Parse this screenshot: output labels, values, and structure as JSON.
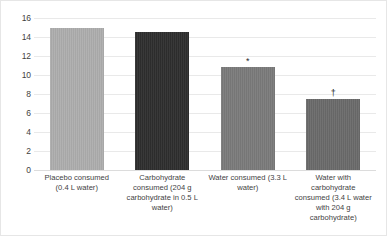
{
  "chart_data": {
    "type": "bar",
    "title": "",
    "subtitle": "",
    "xlabel": "",
    "ylabel": "",
    "ylim": [
      0,
      16
    ],
    "ytick_step": 2,
    "yticks": [
      "16",
      "14",
      "12",
      "10",
      "8",
      "6",
      "4",
      "2",
      "0"
    ],
    "grid": "horizontal",
    "legend": "none",
    "categories": [
      "Placebo consumed (0.4 L water)",
      "Carbohydrate consumed (204 g carbohydrate in 0.5 L water)",
      "Water consumed (3.3 L water)",
      "Water with carbohydrate consumed (3.4 L water with 204 g carbohydrate)"
    ],
    "values": [
      15.0,
      14.5,
      10.8,
      7.5
    ],
    "annotations": [
      "",
      "",
      "*",
      "†"
    ],
    "bar_colors": [
      "#adadad",
      "#2e2e2e",
      "#7a7a7a",
      "#6a6a6a"
    ],
    "grid_color": "#e9e9e9",
    "axis_text_color": "#3f3f3f",
    "background_color": "#ffffff",
    "border_color": "#e6e6e6"
  }
}
